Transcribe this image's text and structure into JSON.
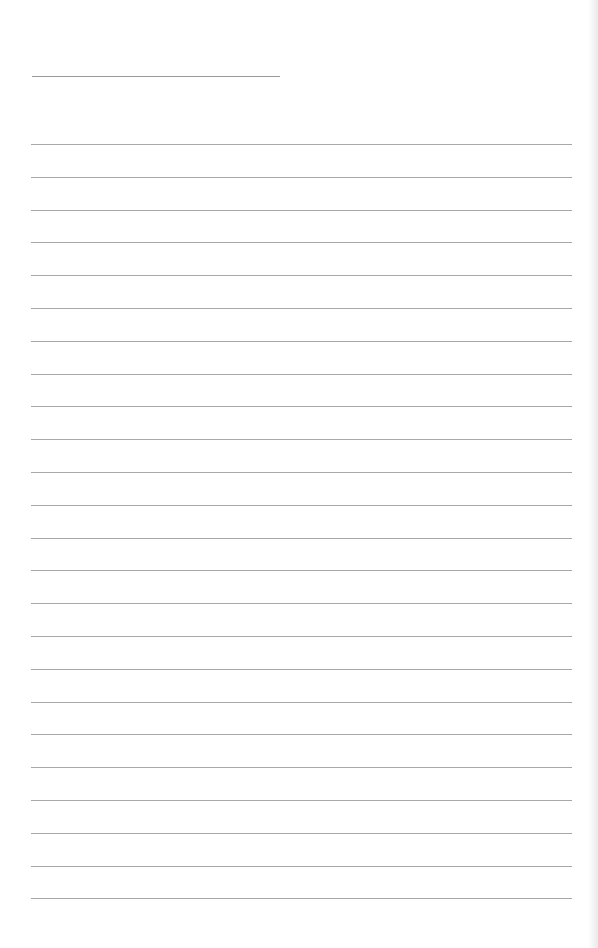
{
  "document": {
    "type": "lined-paper",
    "name_line": {
      "x": 32,
      "y": 76,
      "width": 248
    },
    "rules": {
      "count": 24,
      "first_y": 144,
      "spacing": 32.8,
      "x": 31,
      "width": 541
    },
    "colors": {
      "paper": "#ffffff",
      "rule": "#a8a8a8",
      "name_line": "#9a9a9a"
    }
  }
}
